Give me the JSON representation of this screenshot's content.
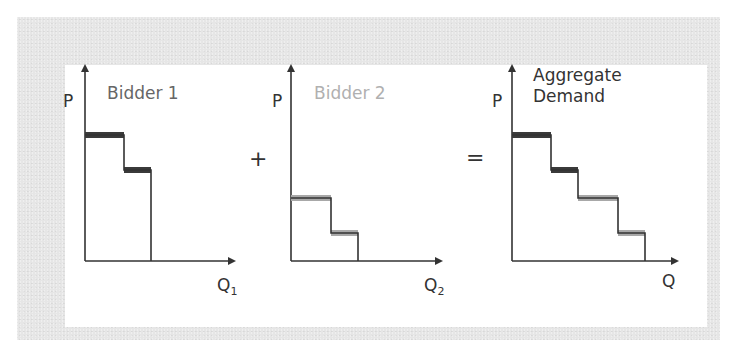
{
  "diagram": {
    "operators": {
      "plus": "+",
      "equals": "="
    },
    "panels": [
      {
        "id": "bidder-1",
        "title": "Bidder 1",
        "title_color": "#666666",
        "y_label": "P",
        "x_label": "Q",
        "x_label_sub": "1",
        "step_color": "#3a3a3a",
        "steps": [
          {
            "from_q": 0,
            "to_q": 39,
            "price": 135
          },
          {
            "from_q": 39,
            "to_q": 66,
            "price": 170
          }
        ]
      },
      {
        "id": "bidder-2",
        "title": "Bidder 2",
        "title_color": "#b0b0b0",
        "y_label": "P",
        "x_label": "Q",
        "x_label_sub": "2",
        "step_color": "#a8a8a8",
        "steps": [
          {
            "from_q": 0,
            "to_q": 40,
            "price": 198
          },
          {
            "from_q": 40,
            "to_q": 67,
            "price": 233
          }
        ]
      },
      {
        "id": "aggregate",
        "title_line1": "Aggregate",
        "title_line2": "Demand",
        "title_color": "#333333",
        "y_label": "P",
        "x_label": "Q",
        "x_label_sub": "",
        "steps": [
          {
            "from_q": 0,
            "to_q": 39,
            "price": 135,
            "color": "#3a3a3a"
          },
          {
            "from_q": 39,
            "to_q": 66,
            "price": 170,
            "color": "#3a3a3a"
          },
          {
            "from_q": 66,
            "to_q": 106,
            "price": 198,
            "color": "#a8a8a8"
          },
          {
            "from_q": 106,
            "to_q": 133,
            "price": 233,
            "color": "#a8a8a8"
          }
        ]
      }
    ],
    "colors": {
      "axis": "#333333",
      "frame": "#e6e6e6",
      "background": "#ffffff",
      "bidder1": "#3a3a3a",
      "bidder2": "#a8a8a8"
    }
  }
}
